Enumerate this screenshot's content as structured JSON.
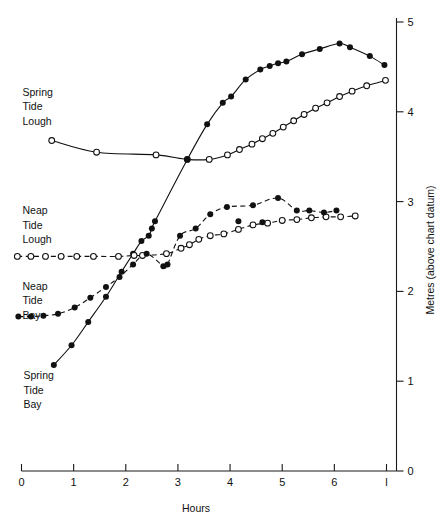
{
  "chart_data": {
    "type": "scatter",
    "title": "",
    "xlabel": "Hours",
    "ylabel": "Metres (above chart datum)",
    "xlim": [
      0,
      7
    ],
    "ylim": [
      0,
      5
    ],
    "grid": false,
    "legend_position": "inline-annotations",
    "xticks": [
      "0",
      "1",
      "2",
      "3",
      "4",
      "5",
      "6",
      "7"
    ],
    "xticklabels": [
      "0",
      "1",
      "2",
      "3",
      "4",
      "5",
      "6",
      "l"
    ],
    "yticks": [
      "0",
      "1",
      "2",
      "3",
      "4",
      "5"
    ],
    "yticklabels": [
      "0",
      "1",
      "2",
      "3",
      "4",
      "5"
    ],
    "yaxis_side": "right",
    "marker_legend": {
      "filled_circle": "Bay",
      "open_circle": "Lough"
    },
    "series": [
      {
        "name": "Spring Tide Lough",
        "marker": "open-circle",
        "line": "solid",
        "label_x": 0.0,
        "label_y": 4.18,
        "points": [
          {
            "x": 0.58,
            "y": 3.68
          },
          {
            "x": 1.44,
            "y": 3.55
          },
          {
            "x": 2.58,
            "y": 3.52
          },
          {
            "x": 3.18,
            "y": 3.47
          },
          {
            "x": 3.6,
            "y": 3.47
          },
          {
            "x": 3.95,
            "y": 3.52
          },
          {
            "x": 4.18,
            "y": 3.58
          },
          {
            "x": 4.42,
            "y": 3.64
          },
          {
            "x": 4.62,
            "y": 3.7
          },
          {
            "x": 4.82,
            "y": 3.76
          },
          {
            "x": 5.02,
            "y": 3.83
          },
          {
            "x": 5.22,
            "y": 3.9
          },
          {
            "x": 5.42,
            "y": 3.97
          },
          {
            "x": 5.64,
            "y": 4.04
          },
          {
            "x": 5.86,
            "y": 4.1
          },
          {
            "x": 6.1,
            "y": 4.17
          },
          {
            "x": 6.34,
            "y": 4.23
          },
          {
            "x": 6.62,
            "y": 4.29
          },
          {
            "x": 6.98,
            "y": 4.35
          }
        ]
      },
      {
        "name": "Spring Tide Bay",
        "marker": "filled-circle",
        "line": "solid",
        "label_x": 0.02,
        "label_y": 1.02,
        "points": [
          {
            "x": 0.62,
            "y": 1.18
          },
          {
            "x": 0.96,
            "y": 1.4
          },
          {
            "x": 1.28,
            "y": 1.66
          },
          {
            "x": 1.62,
            "y": 1.94
          },
          {
            "x": 1.92,
            "y": 2.22
          },
          {
            "x": 2.14,
            "y": 2.42
          },
          {
            "x": 2.3,
            "y": 2.56
          },
          {
            "x": 2.44,
            "y": 2.62
          },
          {
            "x": 2.5,
            "y": 2.7
          },
          {
            "x": 2.56,
            "y": 2.78
          },
          {
            "x": 3.18,
            "y": 3.47
          },
          {
            "x": 3.56,
            "y": 3.86
          },
          {
            "x": 3.86,
            "y": 4.1
          },
          {
            "x": 4.02,
            "y": 4.17
          },
          {
            "x": 4.3,
            "y": 4.36
          },
          {
            "x": 4.58,
            "y": 4.47
          },
          {
            "x": 4.76,
            "y": 4.51
          },
          {
            "x": 4.92,
            "y": 4.54
          },
          {
            "x": 5.08,
            "y": 4.56
          },
          {
            "x": 5.38,
            "y": 4.64
          },
          {
            "x": 5.72,
            "y": 4.7
          },
          {
            "x": 6.1,
            "y": 4.76
          },
          {
            "x": 6.3,
            "y": 4.72
          },
          {
            "x": 6.68,
            "y": 4.62
          },
          {
            "x": 6.96,
            "y": 4.52
          }
        ]
      },
      {
        "name": "Neap Tide Lough",
        "marker": "open-circle",
        "line": "dashed",
        "label_x": 0.0,
        "label_y": 2.86,
        "points": [
          {
            "x": -0.08,
            "y": 2.39
          },
          {
            "x": 0.18,
            "y": 2.39
          },
          {
            "x": 0.46,
            "y": 2.39
          },
          {
            "x": 0.76,
            "y": 2.39
          },
          {
            "x": 1.06,
            "y": 2.39
          },
          {
            "x": 1.38,
            "y": 2.39
          },
          {
            "x": 1.86,
            "y": 2.39
          },
          {
            "x": 2.16,
            "y": 2.4
          },
          {
            "x": 2.32,
            "y": 2.4
          },
          {
            "x": 2.78,
            "y": 2.42
          },
          {
            "x": 3.06,
            "y": 2.48
          },
          {
            "x": 3.22,
            "y": 2.52
          },
          {
            "x": 3.4,
            "y": 2.58
          },
          {
            "x": 3.62,
            "y": 2.62
          },
          {
            "x": 3.88,
            "y": 2.64
          },
          {
            "x": 4.16,
            "y": 2.69
          },
          {
            "x": 4.44,
            "y": 2.74
          },
          {
            "x": 4.72,
            "y": 2.76
          },
          {
            "x": 5.0,
            "y": 2.79
          },
          {
            "x": 5.28,
            "y": 2.8
          },
          {
            "x": 5.56,
            "y": 2.82
          },
          {
            "x": 5.84,
            "y": 2.83
          },
          {
            "x": 6.12,
            "y": 2.83
          },
          {
            "x": 6.4,
            "y": 2.84
          }
        ]
      },
      {
        "name": "Neap Tide Bay",
        "marker": "filled-circle",
        "line": "dashed",
        "label_x": 0.0,
        "label_y": 2.02,
        "points": [
          {
            "x": -0.06,
            "y": 1.72
          },
          {
            "x": 0.18,
            "y": 1.72
          },
          {
            "x": 0.42,
            "y": 1.73
          },
          {
            "x": 0.7,
            "y": 1.75
          },
          {
            "x": 1.02,
            "y": 1.82
          },
          {
            "x": 1.32,
            "y": 1.93
          },
          {
            "x": 1.62,
            "y": 2.05
          },
          {
            "x": 1.88,
            "y": 2.16
          },
          {
            "x": 2.14,
            "y": 2.3
          },
          {
            "x": 2.4,
            "y": 2.42
          },
          {
            "x": 2.72,
            "y": 2.28
          },
          {
            "x": 2.8,
            "y": 2.3
          },
          {
            "x": 3.04,
            "y": 2.62
          },
          {
            "x": 3.34,
            "y": 2.7
          },
          {
            "x": 3.62,
            "y": 2.86
          },
          {
            "x": 3.94,
            "y": 2.94
          },
          {
            "x": 4.16,
            "y": 2.78
          },
          {
            "x": 4.44,
            "y": 2.96
          },
          {
            "x": 4.62,
            "y": 2.77
          },
          {
            "x": 4.92,
            "y": 3.04
          },
          {
            "x": 5.28,
            "y": 2.9
          },
          {
            "x": 5.52,
            "y": 2.9
          },
          {
            "x": 5.8,
            "y": 2.88
          },
          {
            "x": 6.04,
            "y": 2.9
          }
        ]
      }
    ]
  }
}
